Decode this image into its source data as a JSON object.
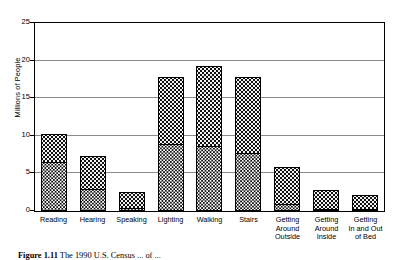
{
  "chart_data": {
    "type": "bar",
    "stacked": true,
    "title": "",
    "xlabel": "",
    "ylabel": "Millions of People",
    "ylim": [
      0,
      25
    ],
    "yticks": [
      0,
      5,
      10,
      15,
      20,
      25
    ],
    "ytick_labels": [
      "0",
      "5",
      "10",
      "15",
      "20",
      "25"
    ],
    "grid": true,
    "grid_axis": "y",
    "legend": null,
    "categories": [
      "Reading",
      "Hearing",
      "Speaking",
      "Lighting",
      "Walking",
      "Stairs",
      "Getting Around Outside",
      "Getting Around Inside",
      "Getting In and Out of Bed"
    ],
    "category_label_lines": [
      [
        "Reading"
      ],
      [
        "Hearing"
      ],
      [
        "Speaking"
      ],
      [
        "Lighting"
      ],
      [
        "Walking"
      ],
      [
        "Stairs"
      ],
      [
        "Getting",
        "Around",
        "Outside"
      ],
      [
        "Getting",
        "Around",
        "Inside"
      ],
      [
        "Getting",
        "In and Out",
        "of Bed"
      ]
    ],
    "series": [
      {
        "name": "dark-segment",
        "pattern": "dark-crosshatch",
        "values": [
          6.5,
          2.9,
          0.4,
          8.9,
          8.6,
          7.7,
          0.9,
          0.2,
          0.2
        ]
      },
      {
        "name": "light-segment",
        "pattern": "light-dotted",
        "values": [
          3.8,
          4.4,
          2.1,
          8.9,
          10.7,
          10.1,
          5.0,
          2.5,
          1.8
        ]
      }
    ],
    "totals": [
      10.3,
      7.3,
      2.5,
      17.8,
      19.3,
      17.8,
      5.9,
      2.7,
      2.0
    ]
  },
  "caption": {
    "label": "Figure 1.11",
    "text": "The 1990 U.S. Census ... of ..."
  }
}
